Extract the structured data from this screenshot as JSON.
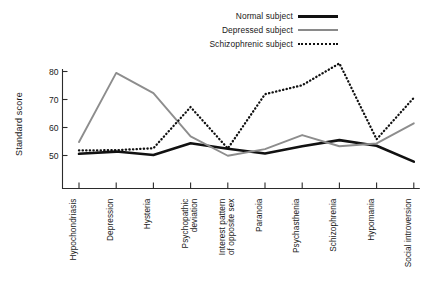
{
  "chart_data": {
    "type": "line",
    "title": "",
    "xlabel": "",
    "ylabel": "Standard score",
    "ylim": [
      40,
      85
    ],
    "yticks": [
      50,
      60,
      70,
      80
    ],
    "grid": false,
    "legend_position": "top-right",
    "categories": [
      "Hypochondriasis",
      "Depression",
      "Hysteria",
      "Psychopathic deviation",
      "Interest pattern of opposite sex",
      "Paranoia",
      "Psychasthenia",
      "Schizophrenia",
      "Hypomania",
      "Social introversion"
    ],
    "category_lines": [
      [
        "Hypochondriasis"
      ],
      [
        "Depression"
      ],
      [
        "Hysteria"
      ],
      [
        "Psychopathic",
        "deviation"
      ],
      [
        "Interest pattern",
        "of opposite sex"
      ],
      [
        "Paranoia"
      ],
      [
        "Psychasthenia"
      ],
      [
        "Schizophrenia"
      ],
      [
        "Hypomania"
      ],
      [
        "Social introversion"
      ]
    ],
    "series": [
      {
        "name": "Normal subject",
        "style": "solid-thick",
        "color": "#111111",
        "values": [
          50.6,
          51.4,
          50.2,
          54.4,
          52.4,
          50.7,
          53.3,
          55.5,
          53.5,
          47.8
        ]
      },
      {
        "name": "Depressed subject",
        "style": "solid-thin",
        "color": "#8d8d8d",
        "values": [
          54.8,
          79.5,
          72.3,
          56.8,
          49.9,
          52.3,
          57.3,
          53.3,
          54.3,
          61.5
        ]
      },
      {
        "name": "Schizophrenic subject",
        "style": "dotted",
        "color": "#111111",
        "values": [
          51.8,
          51.9,
          52.6,
          67.3,
          52.5,
          71.9,
          75.1,
          82.9,
          55.8,
          70.6
        ]
      }
    ]
  },
  "legend": {
    "items": [
      {
        "label": "Normal subject",
        "swatch": "solid-thick"
      },
      {
        "label": "Depressed subject",
        "swatch": "solid-thin"
      },
      {
        "label": "Schizophrenic subject",
        "swatch": "dotted"
      }
    ]
  },
  "axes": {
    "y_title": "Standard score",
    "y_tick_labels": [
      "80",
      "70",
      "60",
      "50"
    ]
  }
}
